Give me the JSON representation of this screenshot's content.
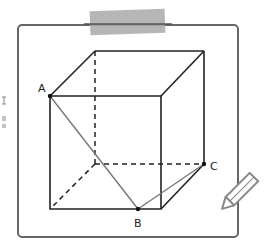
{
  "figure": {
    "type": "cube-diagram",
    "points": [
      {
        "label": "A",
        "x": 50,
        "y": 96,
        "label_x": 38,
        "label_y": 92
      },
      {
        "label": "B",
        "x": 138,
        "y": 209,
        "label_x": 134,
        "label_y": 226
      },
      {
        "label": "C",
        "x": 204,
        "y": 164,
        "label_x": 211,
        "label_y": 169
      }
    ],
    "colors": {
      "edge": "#222222",
      "segment": "#777777",
      "frame": "#666666",
      "tape": "#a8a8a8",
      "pencil": "#888888"
    }
  }
}
